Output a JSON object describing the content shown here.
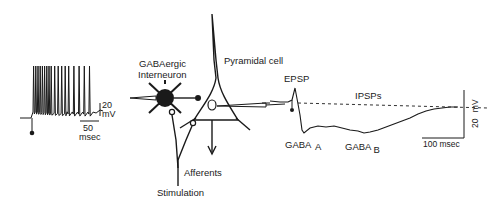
{
  "spike_train": {
    "scale_voltage_value": "20",
    "scale_voltage_unit": "mV",
    "scale_time_value": "50",
    "scale_time_unit": "msec",
    "spike_count": 18
  },
  "circuit": {
    "interneuron_label_line1": "GABAergic",
    "interneuron_label_line2": "Interneuron",
    "pyramidal_label": "Pyramidal cell",
    "afferents_label": "Afferents",
    "stimulation_label": "Stimulation"
  },
  "psp_trace": {
    "epsp_label": "EPSP",
    "ipsps_label": "IPSPs",
    "gaba_a_label": "GABA",
    "gaba_a_sub": "A",
    "gaba_b_label": "GABA",
    "gaba_b_sub": "B",
    "scale_voltage_value": "20",
    "scale_voltage_unit": "mV",
    "scale_time_label": "100 msec"
  },
  "colors": {
    "ink": "#1a1a1a",
    "background": "#ffffff"
  }
}
